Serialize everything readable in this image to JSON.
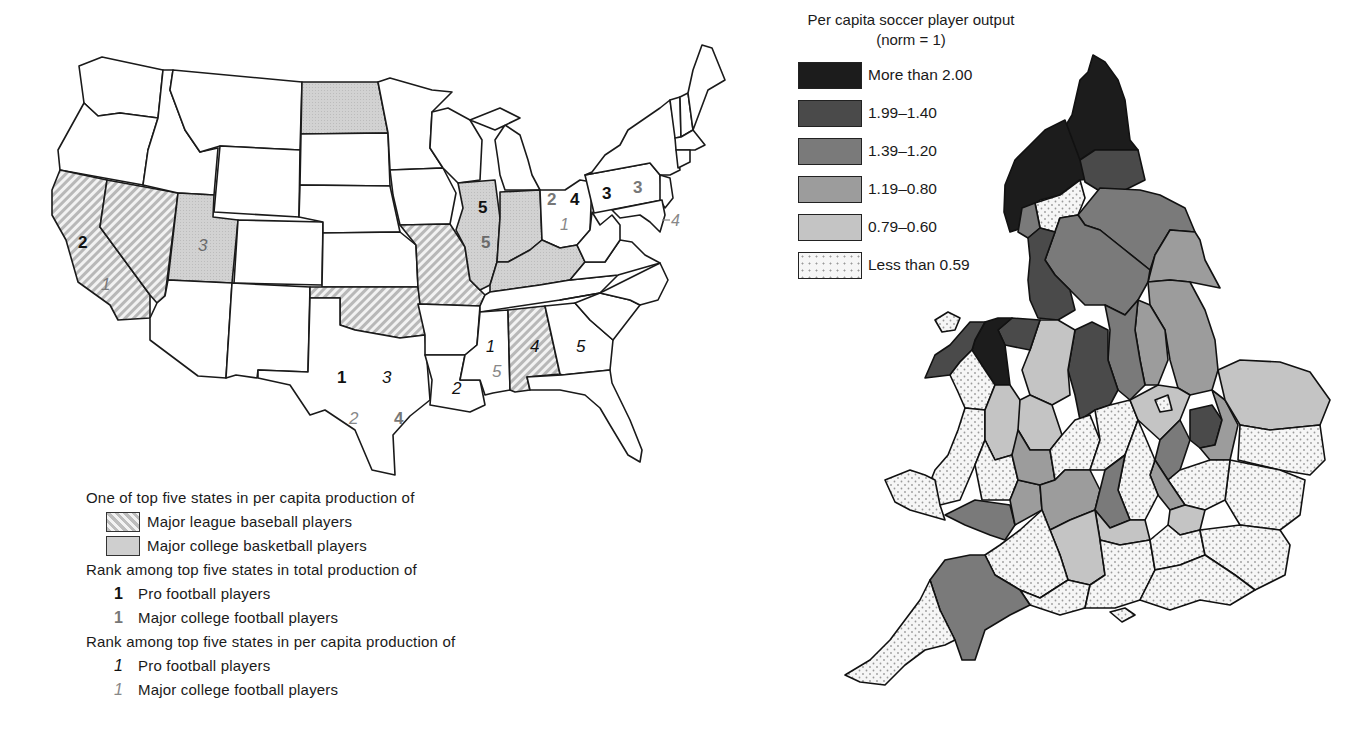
{
  "us_map": {
    "legend": {
      "per_capita_heading": "One of top five states in per capita production of",
      "shading": [
        {
          "pattern": "diagonal-hatch",
          "label": "Major league baseball players"
        },
        {
          "pattern": "gray-stipple",
          "label": "Major college basketball players"
        }
      ],
      "total_heading": "Rank among top five states in total production of",
      "total_items": [
        {
          "symbol": "1",
          "style": "bold-black",
          "label": "Pro football players"
        },
        {
          "symbol": "1",
          "style": "bold-gray",
          "label": "Major college football players"
        }
      ],
      "per_capita_rank_heading": "Rank among top five states in per capita production of",
      "per_capita_items": [
        {
          "symbol": "1",
          "style": "italic-black",
          "label": "Pro football players"
        },
        {
          "symbol": "1",
          "style": "italic-gray",
          "label": "Major college football players"
        }
      ]
    },
    "baseball_states": [
      "California",
      "Nevada",
      "Missouri",
      "Oklahoma",
      "Alabama"
    ],
    "basketball_states": [
      "North Dakota",
      "Utah",
      "Illinois",
      "Indiana",
      "Kentucky"
    ],
    "labels": {
      "california_total_pro": "2",
      "california_pc_college": "1",
      "utah_pc_college": "3",
      "illinois_total_pro": "5",
      "illinois_total_college": "5",
      "ohio_total_college": "2",
      "ohio_total_pro": "4",
      "ohio_pc_college": "1",
      "pennsylvania_total_pro": "3",
      "pennsylvania_total_college": "3",
      "maryland_pc_college": "4",
      "texas_total_pro": "1",
      "texas_pc_pro": "3",
      "texas_pc_college": "2",
      "texas_total_college": "4",
      "louisiana_pc_pro": "2",
      "mississippi_pc_pro": "1",
      "mississippi_pc_college": "5",
      "alabama_pc_pro": "4",
      "georgia_pc_pro": "5"
    }
  },
  "uk_map": {
    "legend": {
      "title_line1": "Per capita soccer player output",
      "title_line2": "(norm = 1)",
      "items": [
        {
          "label": "More than 2.00",
          "color": "#1c1c1c"
        },
        {
          "label": "1.99–1.40",
          "color": "#4a4a4a"
        },
        {
          "label": "1.39–1.20",
          "color": "#7a7a7a"
        },
        {
          "label": "1.19–0.80",
          "color": "#9c9c9c"
        },
        {
          "label": "0.79–0.60",
          "color": "#c4c4c4"
        },
        {
          "label": "Less than 0.59",
          "color": "#f4f4f4"
        }
      ]
    }
  },
  "colors": {
    "outline": "#1a1a1a",
    "basketball_fill": "#cfcfcf",
    "hatch_dark": "#b8b8b8",
    "hatch_light": "#f2f2f2",
    "label_gray": "#7a7a7a"
  }
}
